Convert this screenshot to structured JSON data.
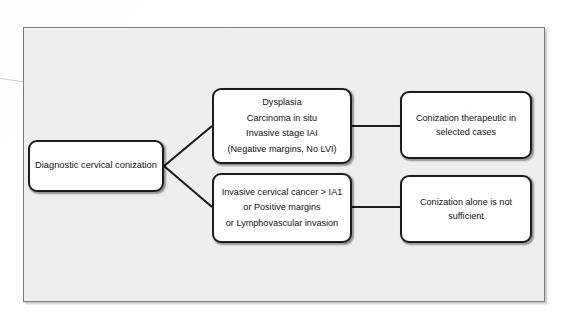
{
  "diagram": {
    "panel_background": "#eeeeee",
    "box_border_color": "#1d1d1d",
    "box_fill": "#ffffff",
    "connector_color": "#1d1d1d",
    "nodes": {
      "start": {
        "id": "diagnostic-cervical-conization",
        "lines": [
          "Diagnostic cervical conization"
        ]
      },
      "branch_benign": {
        "id": "dysplasia-cis-ia1-negative-margins",
        "lines": [
          "Dysplasia",
          "Carcinoma in situ",
          "Invasive stage IAI",
          "(Negative margins, No LVI)"
        ]
      },
      "branch_invasive": {
        "id": "invasive-cancer-positive-margins-lvsi",
        "lines": [
          "Invasive cervical cancer > IA1",
          "or Positive margins",
          "or Lymphovascular invasion"
        ]
      },
      "outcome_therapeutic": {
        "id": "conization-therapeutic-selected-cases",
        "lines": [
          "Conization therapeutic in",
          "selected cases"
        ]
      },
      "outcome_insufficient": {
        "id": "conization-alone-not-sufficient",
        "lines": [
          "Conization alone is not",
          "sufficient"
        ]
      }
    },
    "edges": [
      {
        "from": "start",
        "to": "branch_benign",
        "style": "diagonal"
      },
      {
        "from": "start",
        "to": "branch_invasive",
        "style": "diagonal"
      },
      {
        "from": "branch_benign",
        "to": "outcome_therapeutic",
        "style": "horizontal"
      },
      {
        "from": "branch_invasive",
        "to": "outcome_insufficient",
        "style": "horizontal"
      }
    ]
  }
}
